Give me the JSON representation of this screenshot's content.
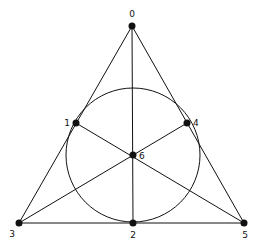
{
  "diagram": {
    "points": [
      {
        "label": "0",
        "x": 132,
        "y": 26,
        "lx": 132,
        "ly": 17,
        "anchor": "middle"
      },
      {
        "label": "1",
        "x": 76,
        "y": 123,
        "lx": 70,
        "ly": 126,
        "anchor": "end"
      },
      {
        "label": "2",
        "x": 133,
        "y": 223,
        "lx": 133,
        "ly": 238,
        "anchor": "middle"
      },
      {
        "label": "3",
        "x": 19,
        "y": 223,
        "lx": 12,
        "ly": 237,
        "anchor": "middle"
      },
      {
        "label": "4",
        "x": 187,
        "y": 123,
        "lx": 193,
        "ly": 126,
        "anchor": "start"
      },
      {
        "label": "5",
        "x": 244,
        "y": 223,
        "lx": 245,
        "ly": 238,
        "anchor": "middle"
      },
      {
        "label": "6",
        "x": 133,
        "y": 155,
        "lx": 139,
        "ly": 159,
        "anchor": "start"
      }
    ],
    "lines": [
      [
        0,
        3
      ],
      [
        0,
        5
      ],
      [
        3,
        5
      ],
      [
        0,
        2
      ],
      [
        3,
        4
      ],
      [
        5,
        1
      ]
    ],
    "circle": {
      "cx": 133,
      "cy": 155,
      "r": 67
    },
    "colors": {
      "stroke": "#111111",
      "fill": "#ffffff"
    }
  }
}
